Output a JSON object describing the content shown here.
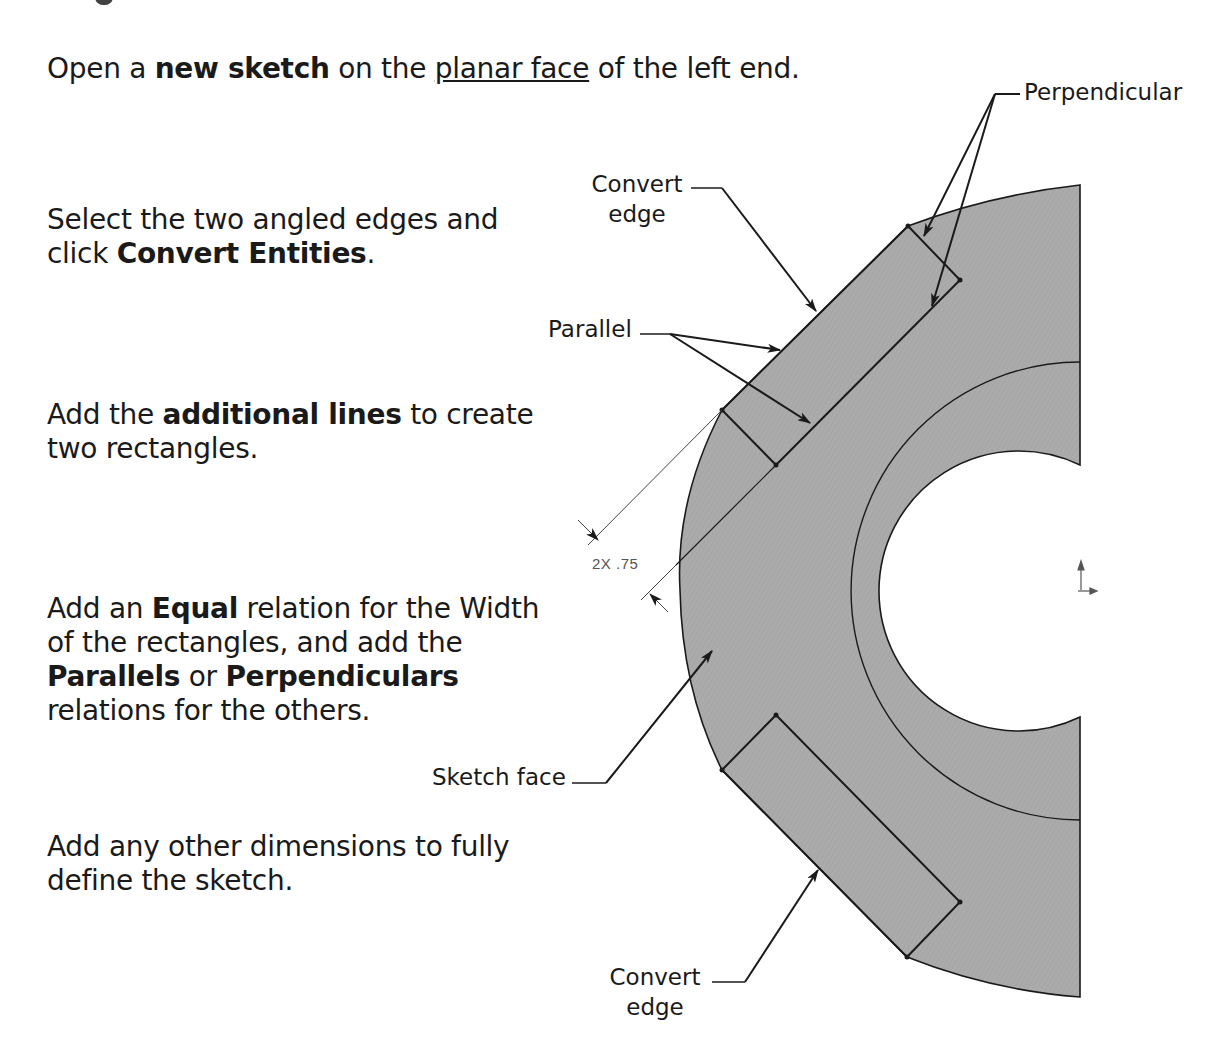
{
  "instructions": {
    "step1": {
      "pre": "Open a ",
      "bold": "new sketch",
      "mid": " on the ",
      "underline": "planar face",
      "post": " of the left end."
    },
    "step2": {
      "pre": "Select the two angled edges and click ",
      "bold": "Convert Entities",
      "post": "."
    },
    "step3": {
      "pre": "Add the ",
      "bold": "additional lines",
      "post": " to create two rectangles."
    },
    "step4": {
      "pre": "Add an ",
      "bold1": "Equal",
      "mid1": " relation for the Width of the rectangles, and add the ",
      "bold2": "Parallels",
      "mid2": " or ",
      "bold3": "Perpendiculars",
      "post": " relations for the others."
    },
    "step5": {
      "text": "Add any other dimensions to fully define the sketch."
    }
  },
  "callouts": {
    "perpendicular": "Perpendicular",
    "convert_edge_top_line1": "Convert",
    "convert_edge_top_line2": "edge",
    "parallel": "Parallel",
    "sketch_face": "Sketch face",
    "convert_edge_bottom_line1": "Convert",
    "convert_edge_bottom_line2": "edge"
  },
  "dimension": {
    "label": "2X .75"
  },
  "colors": {
    "face_fill": "#a9a9a9",
    "line": "#1a1a1a",
    "dim_line": "#444444"
  },
  "icons": [
    "origin-axes-icon",
    "arrowhead-icon"
  ]
}
